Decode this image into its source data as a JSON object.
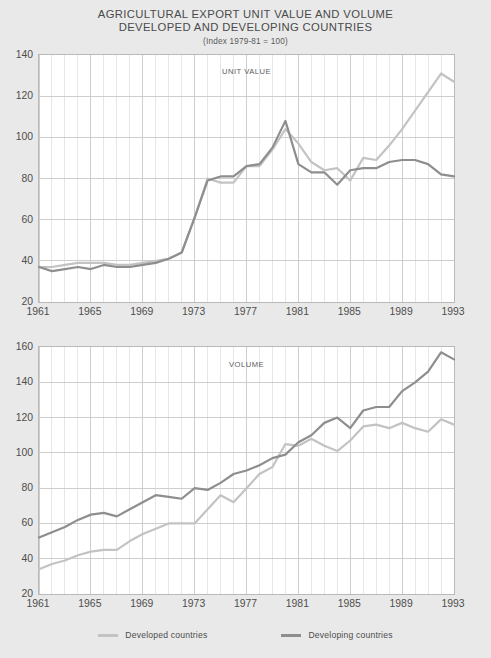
{
  "title": {
    "line1": "AGRICULTURAL EXPORT UNIT VALUE AND VOLUME",
    "line2": "DEVELOPED AND DEVELOPING COUNTRIES",
    "subtitle": "(Index 1979-81 = 100)"
  },
  "legend": {
    "items": [
      {
        "label": "Developed countries",
        "color": "#c3c3c3"
      },
      {
        "label": "Developing countries",
        "color": "#8e8e8e"
      }
    ]
  },
  "colors": {
    "developed": "#c3c3c3",
    "developing": "#8e8e8e",
    "grid": "#c9c9c9",
    "frame": "#b9b9b9",
    "background": "#e9e9e9",
    "plot_background": "#ffffff",
    "text": "#4d4d4d"
  },
  "chart_data": [
    {
      "id": "unit-value",
      "type": "line",
      "title": "UNIT VALUE",
      "xlabel": "",
      "ylabel": "",
      "xlim": [
        1961,
        1993
      ],
      "ylim": [
        20,
        140
      ],
      "yticks": [
        20,
        40,
        60,
        80,
        100,
        120,
        140
      ],
      "xticks": [
        1961,
        1965,
        1969,
        1973,
        1977,
        1981,
        1985,
        1989,
        1993
      ],
      "grid": true,
      "grid_x_step": 1,
      "legend_position": "bottom",
      "x": [
        1961,
        1962,
        1963,
        1964,
        1965,
        1966,
        1967,
        1968,
        1969,
        1970,
        1971,
        1972,
        1973,
        1974,
        1975,
        1976,
        1977,
        1978,
        1979,
        1980,
        1981,
        1982,
        1983,
        1984,
        1985,
        1986,
        1987,
        1988,
        1989,
        1990,
        1991,
        1992,
        1993
      ],
      "series": [
        {
          "name": "Developed countries",
          "color": "#c3c3c3",
          "values": [
            37,
            37,
            38,
            39,
            39,
            39,
            38,
            38,
            39,
            40,
            41,
            44,
            61,
            80,
            78,
            78,
            86,
            86,
            94,
            104,
            97,
            88,
            84,
            85,
            79,
            90,
            89,
            96,
            104,
            113,
            122,
            131,
            127
          ]
        },
        {
          "name": "Developing countries",
          "color": "#8e8e8e",
          "values": [
            37,
            35,
            36,
            37,
            36,
            38,
            37,
            37,
            38,
            39,
            41,
            44,
            61,
            79,
            81,
            81,
            86,
            87,
            95,
            108,
            87,
            83,
            83,
            77,
            84,
            85,
            85,
            88,
            89,
            89,
            87,
            82,
            81
          ]
        }
      ]
    },
    {
      "id": "volume",
      "type": "line",
      "title": "VOLUME",
      "xlabel": "",
      "ylabel": "",
      "xlim": [
        1961,
        1993
      ],
      "ylim": [
        20,
        160
      ],
      "yticks": [
        20,
        40,
        60,
        80,
        100,
        120,
        140,
        160
      ],
      "xticks": [
        1961,
        1965,
        1969,
        1973,
        1977,
        1981,
        1985,
        1989,
        1993
      ],
      "grid": true,
      "grid_x_step": 1,
      "legend_position": "bottom",
      "x": [
        1961,
        1962,
        1963,
        1964,
        1965,
        1966,
        1967,
        1968,
        1969,
        1970,
        1971,
        1972,
        1973,
        1974,
        1975,
        1976,
        1977,
        1978,
        1979,
        1980,
        1981,
        1982,
        1983,
        1984,
        1985,
        1986,
        1987,
        1988,
        1989,
        1990,
        1991,
        1992,
        1993
      ],
      "series": [
        {
          "name": "Developed countries",
          "color": "#c3c3c3",
          "values": [
            34,
            37,
            39,
            42,
            44,
            45,
            45,
            50,
            54,
            57,
            60,
            60,
            60,
            68,
            76,
            72,
            80,
            88,
            92,
            105,
            104,
            108,
            104,
            101,
            107,
            115,
            116,
            114,
            117,
            114,
            112,
            119,
            116
          ]
        },
        {
          "name": "Developing countries",
          "color": "#8e8e8e",
          "values": [
            52,
            55,
            58,
            62,
            65,
            66,
            64,
            68,
            72,
            76,
            75,
            74,
            80,
            79,
            83,
            88,
            90,
            93,
            97,
            99,
            106,
            110,
            117,
            120,
            114,
            124,
            126,
            126,
            135,
            140,
            146,
            157,
            153
          ]
        }
      ]
    }
  ]
}
